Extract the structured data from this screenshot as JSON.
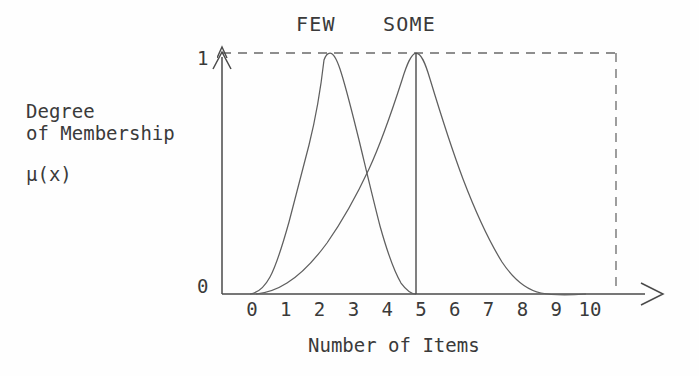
{
  "figure": {
    "background_color": "#fefefe",
    "line_color": "#5a5a5a",
    "text_color": "#3a3a3a"
  },
  "labels": {
    "few": "FEW",
    "some": "SOME",
    "y_axis_line1": "Degree",
    "y_axis_line2": "of Membership",
    "y_axis_symbol": "μ(x)",
    "x_axis_title": "Number of Items",
    "y_tick_top": "1",
    "y_tick_bottom": "0"
  },
  "chart_data": {
    "type": "line",
    "title": "",
    "subtitle": "",
    "xlabel": "Number of Items",
    "ylabel": "Degree of Membership μ(x)",
    "xlim": [
      0,
      11.5
    ],
    "ylim": [
      0,
      1.12
    ],
    "grid": false,
    "legend_position": "above-curve-peaks",
    "x_ticks": [
      "0",
      "1",
      "2",
      "3",
      "4",
      "5",
      "6",
      "7",
      "8",
      "9",
      "10"
    ],
    "x_tick_values": [
      0,
      1,
      2,
      3,
      4,
      5,
      6,
      7,
      8,
      9,
      10
    ],
    "y_ticks": [
      "0",
      "1"
    ],
    "y_tick_values": [
      0,
      1
    ],
    "annotations": [
      {
        "name": "few-peak-label",
        "text": "FEW",
        "x": 2.05,
        "y": 1.06
      },
      {
        "name": "some-peak-label",
        "text": "SOME",
        "x": 4.85,
        "y": 1.06
      }
    ],
    "reference_lines": [
      {
        "name": "top-dashed-line",
        "style": "dashed",
        "orientation": "horizontal",
        "y": 1
      },
      {
        "name": "right-dashed-line",
        "style": "dashed",
        "orientation": "vertical",
        "x": 11.65
      },
      {
        "name": "some-peak-vertical",
        "style": "solid",
        "orientation": "vertical",
        "x": 5
      }
    ],
    "series": [
      {
        "name": "FEW",
        "peak_x": 2.1,
        "peak_y": 1,
        "support": [
          0,
          5
        ],
        "x": [
          0.0,
          0.25,
          0.5,
          0.75,
          1.0,
          1.25,
          1.5,
          1.75,
          2.0,
          2.1,
          2.25,
          2.5,
          2.75,
          3.0,
          3.25,
          3.5,
          3.75,
          4.0,
          4.25,
          4.5,
          4.75,
          5.0
        ],
        "values": [
          0.0,
          0.02,
          0.08,
          0.2,
          0.42,
          0.66,
          0.85,
          0.97,
          1.0,
          1.0,
          0.99,
          0.93,
          0.83,
          0.7,
          0.56,
          0.42,
          0.29,
          0.18,
          0.1,
          0.05,
          0.02,
          0.0
        ]
      },
      {
        "name": "SOME",
        "peak_x": 5.0,
        "peak_y": 1,
        "support": [
          0,
          9.8
        ],
        "x": [
          0.0,
          0.5,
          1.0,
          1.5,
          2.0,
          2.5,
          3.0,
          3.5,
          4.0,
          4.5,
          5.0,
          5.5,
          6.0,
          6.5,
          7.0,
          7.5,
          8.0,
          8.5,
          9.0,
          9.4,
          9.8
        ],
        "values": [
          0.0,
          0.02,
          0.07,
          0.15,
          0.27,
          0.42,
          0.58,
          0.74,
          0.88,
          0.97,
          1.0,
          0.98,
          0.92,
          0.82,
          0.68,
          0.53,
          0.37,
          0.23,
          0.11,
          0.05,
          0.0
        ]
      }
    ]
  },
  "geometry": {
    "origin_x": 222,
    "origin_y": 294,
    "unit_px": 33.8,
    "top_y": 53,
    "x_axis_end": 662,
    "right_dashed_x": 616
  }
}
